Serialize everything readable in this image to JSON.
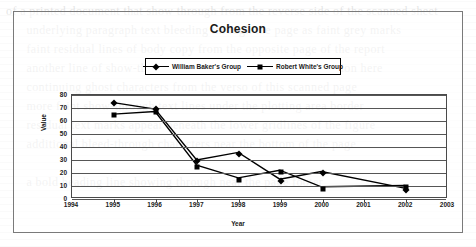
{
  "chart_data": {
    "type": "line",
    "title": "Cohesion",
    "xlabel": "Year",
    "ylabel": "Value",
    "categories": [
      "1994",
      "1995",
      "1996",
      "1997",
      "1998",
      "1999",
      "2000",
      "2001",
      "2002",
      "2003"
    ],
    "x": [
      1994,
      1995,
      1996,
      1997,
      1998,
      1999,
      2000,
      2001,
      2002,
      2003
    ],
    "xlim": [
      1994,
      2003
    ],
    "ylim": [
      0,
      80
    ],
    "yticks": [
      0,
      10,
      20,
      30,
      40,
      50,
      60,
      70,
      80
    ],
    "grid": true,
    "legend_position": "top-center",
    "series": [
      {
        "name": "William Baker's Group",
        "marker": "diamond",
        "color": "#000000",
        "x": [
          1995,
          1996,
          1997,
          1998,
          1999,
          2000,
          2002
        ],
        "values": [
          74,
          69,
          29,
          35,
          14,
          20,
          7
        ]
      },
      {
        "name": "Robert White's Group",
        "marker": "square",
        "color": "#000000",
        "x": [
          1995,
          1996,
          1997,
          1998,
          1999,
          2000,
          2002
        ],
        "values": [
          65,
          67,
          25,
          15,
          21,
          8,
          9
        ]
      }
    ]
  },
  "legend": {
    "items": [
      {
        "label": "William Baker's Group",
        "marker": "diamond"
      },
      {
        "label": "Robert White's Group",
        "marker": "square"
      }
    ]
  },
  "page": {
    "ghost_text": "of a printed document that show through from the reverse side of the scanned sheet\n      underlying paragraph text bleeding through the page as faint grey marks\n      faint residual lines of body copy from the opposite page of the report\n      another line of show-through text behind the chart frame region here\n      continuing ghost characters from the verso of this scanned page\n      more faint show-through text lines under the plotting area border\n      residual text marks appear beneath the lower gridlines of the figure\n      additional bleed-through characters near the bottom of the page\n\n      a bold heading line showing through near the page footer"
  }
}
